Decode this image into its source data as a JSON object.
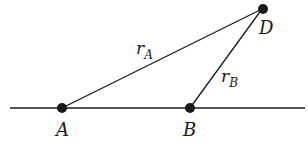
{
  "diagram": {
    "points": [
      {
        "id": "A",
        "label": "A"
      },
      {
        "id": "B",
        "label": "B"
      },
      {
        "id": "D",
        "label": "D"
      }
    ],
    "segments": [
      {
        "from": "A",
        "to": "D",
        "label": "r",
        "subscript": "A"
      },
      {
        "from": "B",
        "to": "D",
        "label": "r",
        "subscript": "B"
      }
    ],
    "baseline": {
      "through": [
        "A",
        "B"
      ]
    },
    "colors": {
      "stroke": "#1a1a1a",
      "point": "#1a1a1a"
    }
  }
}
